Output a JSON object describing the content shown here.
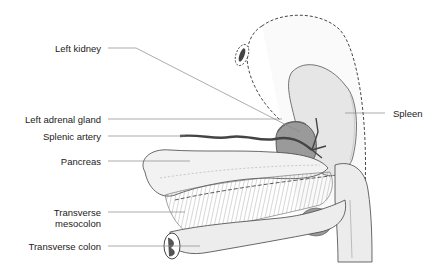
{
  "diagram": {
    "type": "anatomical-illustration",
    "labels": [
      {
        "id": "left-kidney",
        "text": "Left kidney",
        "side": "left"
      },
      {
        "id": "left-adrenal-gland",
        "text": "Left adrenal gland",
        "side": "left"
      },
      {
        "id": "splenic-artery",
        "text": "Splenic artery",
        "side": "left"
      },
      {
        "id": "pancreas",
        "text": "Pancreas",
        "side": "left"
      },
      {
        "id": "transverse-mesocolon",
        "text": "Transverse\nmesocolon",
        "line1": "Transverse",
        "line2": "mesocolon",
        "side": "left"
      },
      {
        "id": "transverse-colon",
        "text": "Transverse colon",
        "side": "left"
      },
      {
        "id": "spleen",
        "text": "Spleen",
        "side": "right"
      }
    ],
    "colors": {
      "organ_fill": "#ededed",
      "organ_shadow": "#d6d6d6",
      "kidney_fill": "#9a9a9a",
      "artery": "#444444",
      "outline": "#333333",
      "leader_line": "#888888",
      "text": "#222222"
    }
  }
}
